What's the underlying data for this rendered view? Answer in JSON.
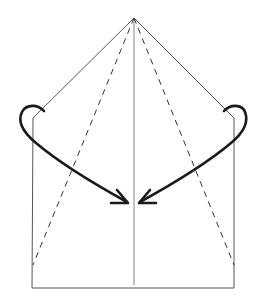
{
  "diagram": {
    "type": "origami-fold-instruction",
    "colors": {
      "background": "#ffffff",
      "outline": "#555555",
      "fold_line": "#333333",
      "arrow": "#1a1a1a"
    },
    "shape": {
      "apex": [
        134,
        18
      ],
      "left_shoulder": [
        33,
        118
      ],
      "right_shoulder": [
        234,
        118
      ],
      "bottom_left": [
        32,
        288
      ],
      "bottom_right": [
        234,
        288
      ]
    },
    "center_crease": {
      "from": [
        134,
        18
      ],
      "to": [
        134,
        285
      ]
    },
    "valley_folds": [
      {
        "from": [
          134,
          18
        ],
        "to": [
          33,
          265
        ]
      },
      {
        "from": [
          134,
          18
        ],
        "to": [
          234,
          265
        ]
      }
    ],
    "arrows": [
      {
        "side": "left",
        "tip": [
          128,
          203
        ]
      },
      {
        "side": "right",
        "tip": [
          139,
          203
        ]
      }
    ]
  }
}
